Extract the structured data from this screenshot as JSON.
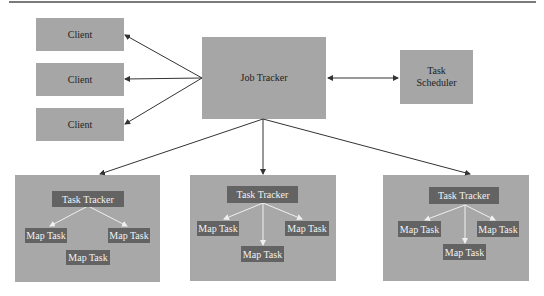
{
  "diagram": {
    "clients": [
      {
        "label": "Client"
      },
      {
        "label": "Client"
      },
      {
        "label": "Client"
      }
    ],
    "job_tracker": {
      "label": "Job Tracker"
    },
    "task_scheduler": {
      "label_line1": "Task",
      "label_line2": "Scheduler"
    },
    "panels": [
      {
        "task_tracker": "Task Tracker",
        "map_tasks": [
          "Map Task",
          "Map Task",
          "Map Task"
        ]
      },
      {
        "task_tracker": "Task Tracker",
        "map_tasks": [
          "Map Task",
          "Map Task",
          "Map Task"
        ]
      },
      {
        "task_tracker": "Task Tracker",
        "map_tasks": [
          "Map Task",
          "Map Task",
          "Map Task"
        ]
      }
    ],
    "colors": {
      "box_fill": "#a6a6a6",
      "inner_box_fill": "#636363",
      "arrow": "#333333",
      "inner_arrow": "#f0f0f0"
    }
  }
}
